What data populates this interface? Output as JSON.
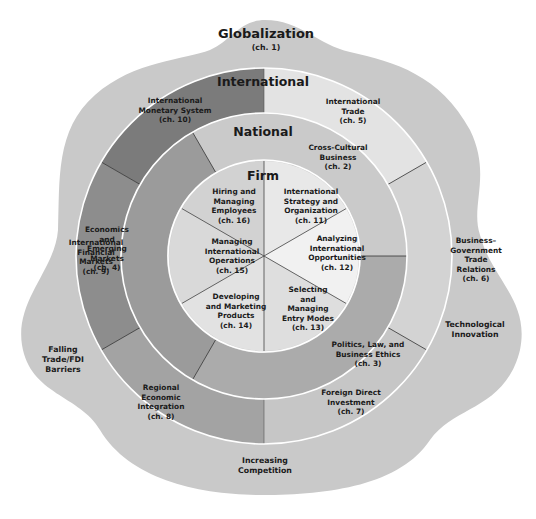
{
  "diagram": {
    "type": "concentric-layer-diagram",
    "outer_layer": {
      "title": "Globalization",
      "chapter": "(ch. 1)",
      "forces": [
        {
          "line1": "Falling",
          "line2": "Trade/FDI",
          "line3": "Barriers"
        },
        {
          "line1": "Technological",
          "line2": "Innovation"
        },
        {
          "line1": "Increasing",
          "line2": "Competition"
        }
      ],
      "color": "#c9c9c9"
    },
    "international": {
      "title": "International",
      "segments": [
        {
          "lines": [
            "International",
            "Monetary System",
            "(ch. 10)"
          ],
          "color": "#7b7b7b"
        },
        {
          "lines": [
            "International",
            "Trade",
            "(ch. 5)"
          ],
          "color": "#e3e3e3"
        },
        {
          "lines": [
            "Business–",
            "Government",
            "Trade",
            "Relations",
            "(ch. 6)"
          ],
          "color": "#d3d3d3"
        },
        {
          "lines": [
            "Foreign Direct",
            "Investment",
            "(ch. 7)"
          ],
          "color": "#c6c6c6"
        },
        {
          "lines": [
            "Regional",
            "Economic",
            "Integration",
            "(ch. 8)"
          ],
          "color": "#a3a3a3"
        },
        {
          "lines": [
            "International",
            "Financial",
            "Markets",
            "(ch. 9)"
          ],
          "color": "#8d8d8d"
        }
      ]
    },
    "national": {
      "title": "National",
      "segments": [
        {
          "lines": [
            "Cross-Cultural",
            "Business",
            "(ch. 2)"
          ],
          "color": "#cacaca"
        },
        {
          "lines": [
            "Politics, Law, and",
            "Business Ethics",
            "(ch. 3)"
          ],
          "color": "#ababab"
        },
        {
          "lines": [
            "Economics",
            "and",
            "Emerging",
            "Markets",
            "(ch. 4)"
          ],
          "color": "#9b9b9b"
        }
      ]
    },
    "firm": {
      "title": "Firm",
      "segments": [
        {
          "lines": [
            "Hiring and",
            "Managing",
            "Employees",
            "(ch. 16)"
          ],
          "color": "#d2d2d2"
        },
        {
          "lines": [
            "International",
            "Strategy and",
            "Organization",
            "(ch. 11)"
          ],
          "color": "#e8e8e8"
        },
        {
          "lines": [
            "Analyzing",
            "International",
            "Opportunities",
            "(ch. 12)"
          ],
          "color": "#f1f1f1"
        },
        {
          "lines": [
            "Selecting",
            "and",
            "Managing",
            "Entry Modes",
            "(ch. 13)"
          ],
          "color": "#dedede"
        },
        {
          "lines": [
            "Developing",
            "and Marketing",
            "Products",
            "(ch. 14)"
          ],
          "color": "#e2e2e2"
        },
        {
          "lines": [
            "Managing",
            "International",
            "Operations",
            "(ch. 15)"
          ],
          "color": "#d9d9d9"
        }
      ]
    }
  }
}
